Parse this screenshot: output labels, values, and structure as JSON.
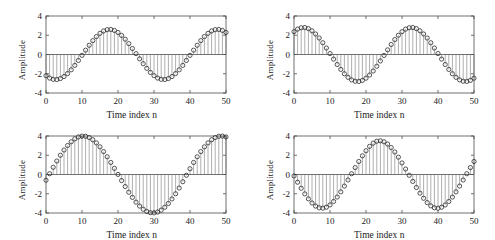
{
  "figure": {
    "title": "",
    "background": "#ffffff",
    "rows": 2,
    "cols": 2
  },
  "axis_labels": {
    "x": "Time index n",
    "y": "Amplitude"
  },
  "colors": {
    "axis": "#4d4d4d",
    "stem": "#6b6b6b",
    "marker": "#2b2b2b",
    "background": "#ffffff"
  },
  "chart_data": [
    {
      "id": "top-left",
      "type": "line",
      "style": "stem",
      "title": "",
      "xlabel": "Time index n",
      "ylabel": "Amplitude",
      "xlim": [
        0,
        50
      ],
      "ylim": [
        -4,
        4
      ],
      "xticks": [
        0,
        10,
        20,
        30,
        40,
        50
      ],
      "yticks": [
        -4,
        -2,
        0,
        2,
        4
      ],
      "xticklabels": [
        "0",
        "10",
        "20",
        "30",
        "40",
        "50"
      ],
      "yticklabels": [
        "-4",
        "-2",
        "0",
        "2",
        "4"
      ],
      "grid": false,
      "legend": null,
      "marker": "circle",
      "amplitude": 2.6,
      "period": 33.5,
      "phase_deg": -122,
      "x": [
        0,
        1,
        2,
        3,
        4,
        5,
        6,
        7,
        8,
        9,
        10,
        11,
        12,
        13,
        14,
        15,
        16,
        17,
        18,
        19,
        20,
        21,
        22,
        23,
        24,
        25,
        26,
        27,
        28,
        29,
        30,
        31,
        32,
        33,
        34,
        35,
        36,
        37,
        38,
        39,
        40,
        41,
        42,
        43,
        44,
        45,
        46,
        47,
        48,
        49,
        50
      ],
      "values": [
        -2.2,
        -2.45,
        -2.58,
        -2.6,
        -2.5,
        -2.29,
        -1.98,
        -1.59,
        -1.13,
        -0.62,
        -0.09,
        0.45,
        0.96,
        1.44,
        1.86,
        2.2,
        2.45,
        2.58,
        2.6,
        2.5,
        2.29,
        1.98,
        1.59,
        1.13,
        0.62,
        0.09,
        -0.45,
        -0.96,
        -1.44,
        -1.86,
        -2.2,
        -2.45,
        -2.58,
        -2.6,
        -2.5,
        -2.29,
        -1.98,
        -1.59,
        -1.13,
        -0.62,
        -0.09,
        0.45,
        0.96,
        1.44,
        1.86,
        2.2,
        2.45,
        2.58,
        2.6,
        2.5,
        2.29
      ]
    },
    {
      "id": "top-right",
      "type": "line",
      "style": "stem",
      "title": "",
      "xlabel": "Time index n",
      "ylabel": "Amplitude",
      "xlim": [
        0,
        50
      ],
      "ylim": [
        -4,
        4
      ],
      "xticks": [
        0,
        10,
        20,
        30,
        40,
        50
      ],
      "yticks": [
        -4,
        -2,
        0,
        2,
        4
      ],
      "xticklabels": [
        "0",
        "10",
        "20",
        "30",
        "40",
        "50"
      ],
      "yticklabels": [
        "-4",
        "-2",
        "0",
        "2",
        "4"
      ],
      "grid": false,
      "legend": null,
      "marker": "circle",
      "amplitude": 2.8,
      "period": 33.5,
      "phase_deg": 58,
      "x": [
        0,
        1,
        2,
        3,
        4,
        5,
        6,
        7,
        8,
        9,
        10,
        11,
        12,
        13,
        14,
        15,
        16,
        17,
        18,
        19,
        20,
        21,
        22,
        23,
        24,
        25,
        26,
        27,
        28,
        29,
        30,
        31,
        32,
        33,
        34,
        35,
        36,
        37,
        38,
        39,
        40,
        41,
        42,
        43,
        44,
        45,
        46,
        47,
        48,
        49,
        50
      ],
      "values": [
        2.37,
        2.64,
        2.78,
        2.8,
        2.69,
        2.46,
        2.13,
        1.71,
        1.22,
        0.67,
        0.1,
        -0.48,
        -1.04,
        -1.55,
        -2.0,
        -2.37,
        -2.64,
        -2.78,
        -2.8,
        -2.69,
        -2.46,
        -2.13,
        -1.71,
        -1.22,
        -0.67,
        -0.1,
        0.48,
        1.04,
        1.55,
        2.0,
        2.37,
        2.64,
        2.78,
        2.8,
        2.69,
        2.46,
        2.13,
        1.71,
        1.22,
        0.67,
        0.1,
        -0.48,
        -1.04,
        -1.55,
        -2.0,
        -2.37,
        -2.64,
        -2.78,
        -2.8,
        -2.69,
        -2.46
      ]
    },
    {
      "id": "bottom-left",
      "type": "line",
      "style": "stem",
      "title": "",
      "xlabel": "Time index n",
      "ylabel": "Amplitude",
      "xlim": [
        0,
        50
      ],
      "ylim": [
        -4,
        4
      ],
      "xticks": [
        0,
        10,
        20,
        30,
        40,
        50
      ],
      "yticks": [
        -4,
        -2,
        0,
        2,
        4
      ],
      "xticklabels": [
        "0",
        "10",
        "20",
        "30",
        "40",
        "50"
      ],
      "yticklabels": [
        "-4",
        "-2",
        "0",
        "2",
        "4"
      ],
      "grid": false,
      "legend": null,
      "marker": "circle",
      "amplitude": 4.0,
      "period": 33.5,
      "phase_deg": -17,
      "x": [
        0,
        1,
        2,
        3,
        4,
        5,
        6,
        7,
        8,
        9,
        10,
        11,
        12,
        13,
        14,
        15,
        16,
        17,
        18,
        19,
        20,
        21,
        22,
        23,
        24,
        25,
        26,
        27,
        28,
        29,
        30,
        31,
        32,
        33,
        34,
        35,
        36,
        37,
        38,
        39,
        40,
        41,
        42,
        43,
        44,
        45,
        46,
        47,
        48,
        49,
        50
      ],
      "values": [
        -0.6,
        0.08,
        0.75,
        1.4,
        2.0,
        2.54,
        3.01,
        3.4,
        3.7,
        3.9,
        3.99,
        3.97,
        3.84,
        3.61,
        3.28,
        2.87,
        2.38,
        1.84,
        1.25,
        0.64,
        0.01,
        -0.63,
        -1.25,
        -1.84,
        -2.38,
        -2.87,
        -3.28,
        -3.61,
        -3.84,
        -3.97,
        -3.99,
        -3.9,
        -3.7,
        -3.4,
        -3.01,
        -2.54,
        -2.0,
        -1.4,
        -0.75,
        -0.08,
        0.6,
        1.25,
        1.84,
        2.38,
        2.87,
        3.28,
        3.61,
        3.84,
        3.97,
        3.99,
        3.9
      ]
    },
    {
      "id": "bottom-right",
      "type": "line",
      "style": "stem",
      "title": "",
      "xlabel": "Time index n",
      "ylabel": "Amplitude",
      "xlim": [
        0,
        50
      ],
      "ylim": [
        -4,
        4
      ],
      "xticks": [
        0,
        10,
        20,
        30,
        40,
        50
      ],
      "yticks": [
        -4,
        -2,
        0,
        2,
        4
      ],
      "xticklabels": [
        "0",
        "10",
        "20",
        "30",
        "40",
        "50"
      ],
      "yticklabels": [
        "-4",
        "-2",
        "0",
        "2",
        "4"
      ],
      "grid": false,
      "legend": null,
      "marker": "circle",
      "amplitude": 3.5,
      "period": 33.5,
      "phase_deg": 175,
      "x": [
        0,
        1,
        2,
        3,
        4,
        5,
        6,
        7,
        8,
        9,
        10,
        11,
        12,
        13,
        14,
        15,
        16,
        17,
        18,
        19,
        20,
        21,
        22,
        23,
        24,
        25,
        26,
        27,
        28,
        29,
        30,
        31,
        32,
        33,
        34,
        35,
        36,
        37,
        38,
        39,
        40,
        41,
        42,
        43,
        44,
        45,
        46,
        47,
        48,
        49,
        50
      ],
      "values": [
        -0.15,
        -0.8,
        -1.43,
        -2.01,
        -2.53,
        -2.96,
        -3.28,
        -3.46,
        -3.5,
        -3.4,
        -3.16,
        -2.8,
        -2.34,
        -1.8,
        -1.2,
        -0.57,
        0.08,
        0.72,
        1.35,
        1.94,
        2.47,
        2.92,
        3.26,
        3.46,
        3.5,
        3.4,
        3.16,
        2.8,
        2.34,
        1.8,
        1.2,
        0.57,
        -0.08,
        -0.72,
        -1.35,
        -1.94,
        -2.47,
        -2.92,
        -3.26,
        -3.46,
        -3.5,
        -3.4,
        -3.16,
        -2.8,
        -2.34,
        -1.8,
        -1.2,
        -0.57,
        0.08,
        0.72,
        1.35
      ]
    }
  ]
}
